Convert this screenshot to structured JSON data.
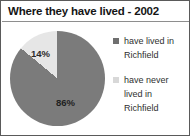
{
  "chart_data": {
    "type": "pie",
    "title": "Where they have lived - 2002",
    "categories": [
      "have lived in Richfield",
      "have never lived in Richfield"
    ],
    "values": [
      86,
      14
    ],
    "value_labels": [
      "86%",
      "14%"
    ],
    "unit": "percent",
    "xlabel": "",
    "ylabel": "",
    "grid": false,
    "legend_position": "right",
    "start_angle_deg": 0,
    "direction": "clockwise",
    "colors": [
      "#7b7b7b",
      "#e6e6e6"
    ],
    "slices": [
      {
        "name": "have lived in Richfield",
        "value": 86,
        "label": "86%",
        "color": "#7b7b7b",
        "start_deg": 0,
        "end_deg": 309.6
      },
      {
        "name": "have never lived in Richfield",
        "value": 14,
        "label": "14%",
        "color": "#e6e6e6",
        "start_deg": 309.6,
        "end_deg": 360
      }
    ]
  },
  "legend": {
    "entries": [
      {
        "label": "have lived in Richfield",
        "swatch_color": "#6f6f6f"
      },
      {
        "label": "have never lived in Richfield",
        "swatch_color": "#d8d8d8"
      }
    ]
  },
  "frame": {
    "border_color": "#5a5a5a",
    "background": "#ffffff",
    "rule_color": "#8e8e8e"
  }
}
